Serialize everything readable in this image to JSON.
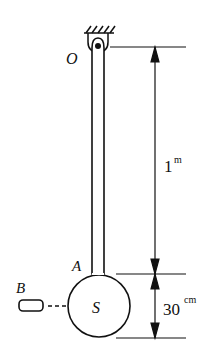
{
  "diagram": {
    "type": "physical pendulum",
    "labels": {
      "pivot": "O",
      "rod_bottom": "A",
      "bob": "S",
      "projectile": "B"
    },
    "dimensions": {
      "rod_length_value": "1",
      "rod_length_unit": "m",
      "sphere_diameter_value": "30",
      "sphere_diameter_unit": "cm"
    },
    "colors": {
      "ink": "#111111",
      "background": "#ffffff"
    }
  }
}
